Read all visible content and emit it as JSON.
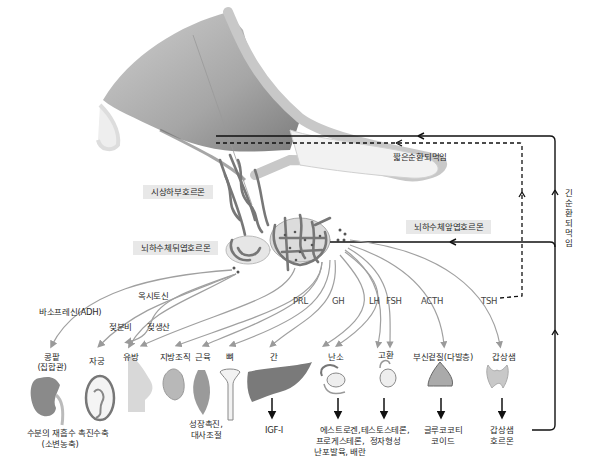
{
  "diagram": {
    "title_regions": {
      "hypothalamic_hormone": "시상하부호르몬",
      "posterior_pituitary_hormone": "뇌하수체뒤엽호르몬",
      "anterior_pituitary_hormone": "뇌하수체앞엽호르몬"
    },
    "feedback": {
      "short_loop": "짧은순환되먹임",
      "long_loop": "긴순환되먹임"
    },
    "posterior_hormones": {
      "adh": "바소프레신(ADH)",
      "oxytocin": "옥시토신",
      "milk_ejection": "젖분비",
      "milk_production": "젖생산"
    },
    "anterior_hormones": [
      "PRL",
      "GH",
      "LH",
      "FSH",
      "ACTH",
      "TSH"
    ],
    "targets": [
      {
        "id": "kidney",
        "label": "콩팥\n(집합관)"
      },
      {
        "id": "uterus",
        "label": "자궁"
      },
      {
        "id": "breast",
        "label": "유방"
      },
      {
        "id": "adipose",
        "label": "지방조직"
      },
      {
        "id": "muscle",
        "label": "근육"
      },
      {
        "id": "bone",
        "label": "뼈"
      },
      {
        "id": "liver",
        "label": "간"
      },
      {
        "id": "ovary",
        "label": "난소"
      },
      {
        "id": "testis",
        "label": "고환"
      },
      {
        "id": "adrenal",
        "label": "부신겉질(다발층)"
      },
      {
        "id": "thyroid",
        "label": "갑상샘"
      }
    ],
    "effects": {
      "kidney_1": "수분의 재흡수 촉진",
      "kidney_2": "(소변농축)",
      "uterus": "수축",
      "growth_1": "성장촉진,",
      "growth_2": "대사조절",
      "liver": "IGF-I",
      "ovary_1": "에스트로겐,",
      "ovary_2": "프로게스테론,",
      "ovary_3": "난포발육, 배란",
      "testis_1": "테스토스테론,",
      "testis_2": "정자형성",
      "adrenal_1": "글루코코티",
      "adrenal_2": "코이드",
      "thyroid_1": "갑상샘",
      "thyroid_2": "호르몬"
    },
    "colors": {
      "hypothalamus": "#8a8a8a",
      "vessel": "#7d7d7d",
      "arrow_gray": "#999999",
      "feedback_line": "#111111",
      "label_box": "#e8e8e8"
    }
  }
}
